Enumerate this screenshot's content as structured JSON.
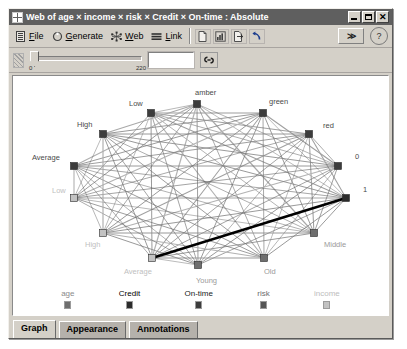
{
  "window": {
    "title": "Web of age × income × risk × Credit × On-time : Absolute",
    "icon": "web-document-icon",
    "buttons": {
      "minimize": "_",
      "maximize": "□",
      "close": "✕"
    }
  },
  "toolbar": {
    "menus": [
      {
        "label_pre": "",
        "mnemonic": "F",
        "label_post": "ile",
        "icon": "file-menu-icon",
        "name": "file"
      },
      {
        "label_pre": "",
        "mnemonic": "G",
        "label_post": "enerate",
        "icon": "generate-icon",
        "name": "generate"
      },
      {
        "label_pre": "",
        "mnemonic": "W",
        "label_post": "eb",
        "icon": "web-icon",
        "name": "web"
      },
      {
        "label_pre": "",
        "mnemonic": "L",
        "label_post": "ink",
        "icon": "link-icon",
        "name": "link"
      }
    ],
    "tools": [
      {
        "name": "new-document-button",
        "icon": "document-icon"
      },
      {
        "name": "chart-button",
        "icon": "bar-chart-icon"
      },
      {
        "name": "export-button",
        "icon": "export-icon"
      },
      {
        "name": "undo-button",
        "icon": "undo-arrow-icon"
      }
    ],
    "overflow_label": "≫",
    "help_label": "?"
  },
  "slider": {
    "min_label": "0",
    "max_label": "220",
    "value": "",
    "value_placeholder": "",
    "thumb_position_pct": 2,
    "link_icon": "chain-link-icon"
  },
  "legend": {
    "items": [
      {
        "label": "age",
        "color": "#6e6e6e",
        "text_color": "#8a8a8a"
      },
      {
        "label": "Credit",
        "color": "#2b2b2b",
        "text_color": "#000000"
      },
      {
        "label": "On-time",
        "color": "#3c3c3c",
        "text_color": "#1a1a1a"
      },
      {
        "label": "risk",
        "color": "#555555",
        "text_color": "#6d6d6d"
      },
      {
        "label": "income",
        "color": "#c2c2c2",
        "text_color": "#bdbdbd"
      }
    ]
  },
  "tabs": [
    {
      "label": "Graph",
      "active": true
    },
    {
      "label": "Appearance",
      "active": false
    },
    {
      "label": "Annotations",
      "active": false
    }
  ],
  "chart_data": {
    "type": "network",
    "title": "Web of age × income × risk × Credit × On-time : Absolute",
    "layout": "circular-ellipse",
    "node_marker": "square",
    "nodes": [
      {
        "id": "credit-low",
        "label": "Low",
        "field": "Credit",
        "x": 138,
        "y": 37,
        "label_dx": -22,
        "label_dy": -7,
        "color": "#3c3c3c",
        "label_color": "#4a4a4a"
      },
      {
        "id": "risk-amber",
        "label": "amber",
        "field": "risk",
        "x": 184,
        "y": 28,
        "label_dx": -2,
        "label_dy": -9,
        "color": "#3c3c3c",
        "label_color": "#4a4a4a"
      },
      {
        "id": "risk-green",
        "label": "green",
        "field": "risk",
        "x": 250,
        "y": 37,
        "label_dx": 6,
        "label_dy": -9,
        "color": "#3c3c3c",
        "label_color": "#4a4a4a"
      },
      {
        "id": "risk-red",
        "label": "red",
        "field": "risk",
        "x": 296,
        "y": 58,
        "label_dx": 14,
        "label_dy": -6,
        "color": "#3c3c3c",
        "label_color": "#4a4a4a"
      },
      {
        "id": "ontime-0",
        "label": "0",
        "field": "On-time",
        "x": 325,
        "y": 90,
        "label_dx": 17,
        "label_dy": -7,
        "color": "#3c3c3c",
        "label_color": "#4a4a4a"
      },
      {
        "id": "ontime-1",
        "label": "1",
        "field": "On-time",
        "x": 333,
        "y": 122,
        "label_dx": 17,
        "label_dy": -6,
        "color": "#2b2b2b",
        "label_color": "#4a4a4a"
      },
      {
        "id": "age-middle",
        "label": "Middle",
        "field": "age",
        "x": 301,
        "y": 157,
        "label_dx": 10,
        "label_dy": 14,
        "color": "#6e6e6e",
        "label_color": "#9a9a9a"
      },
      {
        "id": "age-old",
        "label": "Old",
        "field": "age",
        "x": 251,
        "y": 182,
        "label_dx": 0,
        "label_dy": 16,
        "color": "#6e6e6e",
        "label_color": "#9a9a9a"
      },
      {
        "id": "age-young",
        "label": "Young",
        "field": "age",
        "x": 185,
        "y": 189,
        "label_dx": -2,
        "label_dy": 18,
        "color": "#6e6e6e",
        "label_color": "#9a9a9a"
      },
      {
        "id": "income-avg",
        "label": "Average",
        "field": "income",
        "x": 139,
        "y": 182,
        "label_dx": -28,
        "label_dy": 16,
        "color": "#c2c2c2",
        "label_color": "#c0c0c0"
      },
      {
        "id": "income-high",
        "label": "High",
        "field": "income",
        "x": 90,
        "y": 157,
        "label_dx": -18,
        "label_dy": 14,
        "color": "#c2c2c2",
        "label_color": "#c0c0c0"
      },
      {
        "id": "income-low",
        "label": "Low",
        "field": "income",
        "x": 61,
        "y": 122,
        "label_dx": -22,
        "label_dy": -5,
        "color": "#c2c2c2",
        "label_color": "#c0c0c0"
      },
      {
        "id": "credit-avg",
        "label": "Average",
        "field": "Credit",
        "x": 61,
        "y": 90,
        "label_dx": -42,
        "label_dy": -6,
        "color": "#3c3c3c",
        "label_color": "#4a4a4a"
      },
      {
        "id": "credit-high",
        "label": "High",
        "field": "Credit",
        "x": 90,
        "y": 58,
        "label_dx": -26,
        "label_dy": -7,
        "color": "#3c3c3c",
        "label_color": "#4a4a4a"
      }
    ],
    "edge_style": "all-pairs weighted gray lines, one heavy black link",
    "highlight_edge": {
      "from": "income-avg",
      "to": "ontime-1"
    },
    "xlabel": "",
    "ylabel": ""
  }
}
